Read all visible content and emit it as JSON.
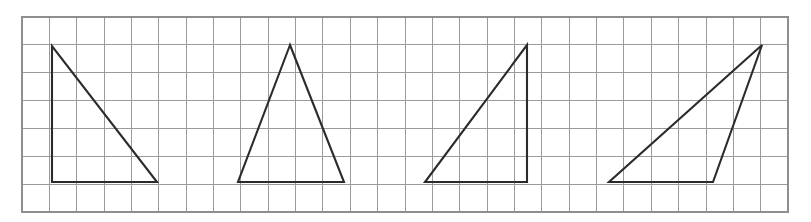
{
  "figure": {
    "background_color": "#ffffff",
    "grid": {
      "line_color": "#9a9a9a",
      "border_color": "#8e8e8e",
      "x_start": 22,
      "y_start": 17,
      "x_end": 788,
      "y_end": 212,
      "cell_width": 27.36,
      "cell_height": 27.86,
      "columns": 28,
      "rows": 7,
      "visible": true
    },
    "shape_color": "#2b2b2b",
    "shape_stroke_width": 2.1,
    "baseline_y": 182,
    "apex_y": 45
  },
  "chart_data": {
    "type": "diagram",
    "xlabel": "",
    "ylabel": "",
    "grid": true,
    "legend": "none",
    "xlim": [
      22,
      788
    ],
    "ylim": [
      17,
      212
    ],
    "shapes": [
      {
        "name": "triangle-1",
        "label": "Right triangle, right angle at bottom-left",
        "vertices": [
          [
            52,
            46
          ],
          [
            52,
            182
          ],
          [
            157,
            182
          ]
        ],
        "base_length_px": 105,
        "height_px": 136
      },
      {
        "name": "triangle-2",
        "label": "Isosceles triangle, apex centered",
        "vertices": [
          [
            290,
            45
          ],
          [
            238,
            182
          ],
          [
            344,
            182
          ]
        ],
        "base_length_px": 106,
        "height_px": 137
      },
      {
        "name": "triangle-3",
        "label": "Right triangle, right angle at bottom-right",
        "vertices": [
          [
            527,
            45
          ],
          [
            425,
            182
          ],
          [
            527,
            182
          ]
        ],
        "base_length_px": 102,
        "height_px": 137
      },
      {
        "name": "triangle-4",
        "label": "Obtuse triangle, apex right of base",
        "vertices": [
          [
            762,
            45
          ],
          [
            609,
            182
          ],
          [
            713,
            182
          ]
        ],
        "base_length_px": 104,
        "height_px": 137
      }
    ]
  }
}
